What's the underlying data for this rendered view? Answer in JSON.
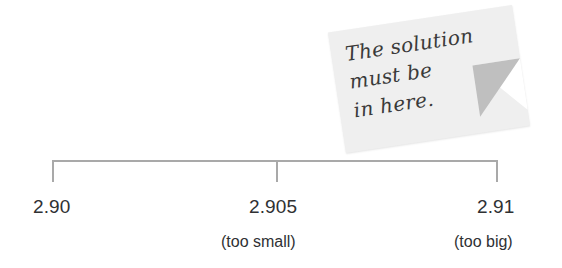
{
  "figure": {
    "type": "number-line-bracket",
    "background_color": "#ffffff",
    "line_color": "#a9a9a9",
    "text_color": "#2f3133"
  },
  "number_line": {
    "ticks": [
      {
        "value": "2.90",
        "annotation": ""
      },
      {
        "value": "2.905",
        "annotation": "(too small)"
      },
      {
        "value": "2.91",
        "annotation": "(too big)"
      }
    ]
  },
  "sticky_note": {
    "background_color": "#efefef",
    "fold_color": "#bfbfbf",
    "lines": [
      "The solution",
      "must be",
      "in here."
    ]
  },
  "chart_data": {
    "type": "line",
    "title": "",
    "xlabel": "",
    "ylabel": "",
    "categories": [
      "2.90",
      "2.905",
      "2.91"
    ],
    "values": [
      2.9,
      2.905,
      2.91
    ],
    "annotations": [
      "",
      "(too small)",
      "(too big)"
    ],
    "xlim": [
      2.9,
      2.91
    ],
    "grid": false,
    "legend": "none",
    "callout": "The solution must be in here."
  }
}
